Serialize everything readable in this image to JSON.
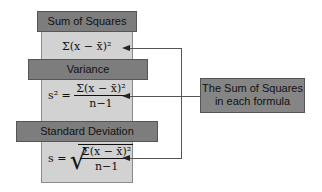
{
  "diagram": {
    "sections": [
      {
        "title": "Sum of Squares",
        "formula": {
          "lhs": "",
          "numerator": "Σ(x − x̄)²",
          "denominator": ""
        }
      },
      {
        "title": "Variance",
        "formula": {
          "lhs": "s² =",
          "numerator": "Σ(x − x̄)²",
          "denominator": "n−1"
        }
      },
      {
        "title": "Standard Deviation",
        "formula": {
          "lhs": "s =",
          "numerator": "Σ(x − x̄)²",
          "denominator": "n−1",
          "radical": "√"
        }
      }
    ],
    "callout": {
      "line1": "The Sum of Squares",
      "line2": "in each formula"
    },
    "colors": {
      "panel": "#d2d2d2",
      "header": "#7d7d7d",
      "callout": "#858585",
      "connector": "#555555"
    }
  }
}
